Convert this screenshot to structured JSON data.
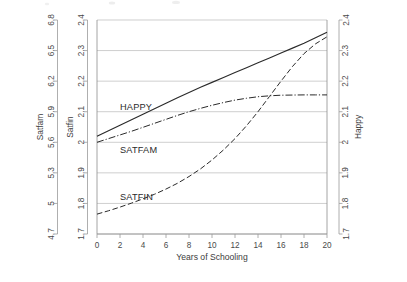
{
  "chart_data": {
    "type": "line",
    "title": "",
    "xlabel": "Years of Schooling",
    "x": [
      0,
      1,
      2,
      3,
      4,
      5,
      6,
      7,
      8,
      9,
      10,
      11,
      12,
      13,
      14,
      15,
      16,
      17,
      18,
      19,
      20
    ],
    "xlim": [
      0,
      20
    ],
    "xticks": [
      0,
      2,
      4,
      6,
      8,
      10,
      12,
      14,
      16,
      18,
      20
    ],
    "grid": true,
    "legend": "inline-labels",
    "axes": [
      {
        "position": "left-outer",
        "label": "Satfam",
        "ticks": [
          6.8,
          6.5,
          6.2,
          5.9,
          5.6,
          5.3,
          5,
          4.7
        ],
        "tick_labels": [
          "6.8",
          "6.5",
          "6.2",
          "5.9",
          "5.6",
          "5.3",
          "5",
          "4.7"
        ],
        "lim": [
          4.7,
          6.8
        ]
      },
      {
        "position": "left-inner",
        "label": "Satfin",
        "ticks": [
          2.4,
          2.3,
          2.2,
          2.1,
          2,
          1.9,
          1.8,
          1.7
        ],
        "tick_labels": [
          "2.4",
          "2.3",
          "2.2",
          "2.1",
          "2",
          "1.9",
          "1.8",
          "1.7"
        ],
        "lim": [
          1.7,
          2.4
        ]
      },
      {
        "position": "right",
        "label": "Happy",
        "ticks": [
          2.4,
          2.3,
          2.2,
          2.1,
          2,
          1.9,
          1.8,
          1.7
        ],
        "tick_labels": [
          "2.4",
          "2.3",
          "2.2",
          "2.1",
          "2",
          "1.9",
          "1.8",
          "1.7"
        ],
        "lim": [
          1.7,
          2.4
        ]
      }
    ],
    "series": [
      {
        "name": "HAPPY",
        "style": "solid",
        "axis": "right",
        "label_x": 2.0,
        "label_y": 2.105,
        "values": [
          2.02,
          2.038,
          2.056,
          2.074,
          2.092,
          2.11,
          2.128,
          2.146,
          2.163,
          2.18,
          2.196,
          2.212,
          2.228,
          2.244,
          2.26,
          2.276,
          2.292,
          2.308,
          2.324,
          2.342,
          2.36
        ]
      },
      {
        "name": "SATFAM",
        "style": "dash-dot",
        "axis": "left-outer",
        "label_x": 2.0,
        "label_y": 1.965,
        "values": [
          2.0,
          2.012,
          2.024,
          2.036,
          2.049,
          2.062,
          2.075,
          2.088,
          2.1,
          2.111,
          2.121,
          2.13,
          2.138,
          2.144,
          2.149,
          2.152,
          2.154,
          2.1545,
          2.155,
          2.155,
          2.155
        ]
      },
      {
        "name": "SATFIN",
        "style": "dashed",
        "axis": "left-inner",
        "label_x": 2.0,
        "label_y": 1.812,
        "values": [
          1.765,
          1.776,
          1.788,
          1.801,
          1.815,
          1.83,
          1.847,
          1.866,
          1.888,
          1.913,
          1.942,
          1.975,
          2.012,
          2.054,
          2.1,
          2.15,
          2.2,
          2.248,
          2.29,
          2.322,
          2.345
        ]
      }
    ]
  }
}
